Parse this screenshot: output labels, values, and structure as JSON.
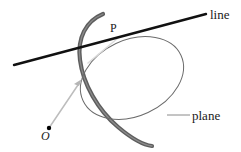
{
  "figure": {
    "labels": {
      "line": "line",
      "plane": "plane",
      "point_p": "P",
      "point_o": "O"
    },
    "colors": {
      "line_stroke": "#111111",
      "plane_outline": "#6b6b6b",
      "plane_rim": "#555555",
      "ray_stroke": "#b0b0b0",
      "ray_faint": "#d8d8d8",
      "leader_stroke": "#8a8a8a",
      "point_fill": "#000000",
      "background": "#ffffff",
      "text": "#1a1a1a"
    },
    "geometry": {
      "ellipse": {
        "cx": 132,
        "cy": 78,
        "rx": 54,
        "ry": 38,
        "rotation_deg": -25
      },
      "line_segment": {
        "x1": 14,
        "y1": 65,
        "x2": 206,
        "y2": 14
      },
      "ray_from_o": {
        "x1": 49,
        "y1": 128,
        "x2": 82,
        "y2": 80
      },
      "ray_to_p": {
        "x1": 88,
        "y1": 63,
        "x2": 118,
        "y2": 38
      },
      "leader_plane": {
        "x1": 167,
        "y1": 115,
        "x2": 190,
        "y2": 115
      },
      "point_o_dot": {
        "cx": 49,
        "cy": 128,
        "r": 2.2
      }
    }
  }
}
